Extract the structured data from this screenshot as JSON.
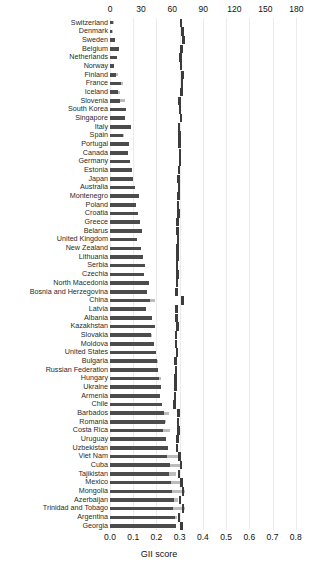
{
  "figure": {
    "axis_title_bottom": "GII score",
    "footnote": ""
  },
  "chart_data": {
    "type": "bar",
    "title": "",
    "subtitle": "",
    "xlabel": "GII score",
    "ylabel": "",
    "orientation": "horizontal",
    "grid": true,
    "legend": "none",
    "top_axis": {
      "label": "",
      "ticks": [
        0,
        30,
        60,
        90,
        120,
        150,
        180
      ],
      "tick_labels": [
        "0",
        "30",
        "60",
        "90",
        "120",
        "150",
        "180"
      ],
      "range": [
        0,
        195
      ],
      "series_name": "GII rank"
    },
    "bottom_axis": {
      "label": "GII score",
      "ticks": [
        0.0,
        0.1,
        0.2,
        0.3,
        0.4,
        0.5,
        0.6,
        0.7,
        0.8
      ],
      "tick_labels": [
        "0.0",
        "0.1",
        "0.2",
        "0.3",
        "0.4",
        "0.5",
        "0.6",
        "0.7",
        "0.8"
      ],
      "range": [
        0.0,
        0.87
      ],
      "series_name": "GII score"
    },
    "categories": [
      "Switzerland",
      "Denmark",
      "Sweden",
      "Belgium",
      "Netherlands",
      "Norway",
      "Finland",
      "France",
      "Iceland",
      "Slovenia",
      "South Korea",
      "Singapore",
      "Italy",
      "Spain",
      "Portugal",
      "Canada",
      "Germany",
      "Estonia",
      "Japan",
      "Australia",
      "Montenegro",
      "Poland",
      "Croatia",
      "Greece",
      "Belarus",
      "United Kingdom",
      "New Zealand",
      "Lithuania",
      "Serbia",
      "Czechia",
      "North Macedonia",
      "Bosnia and Herzegovina",
      "China",
      "Latvia",
      "Albania",
      "Kazakhstan",
      "Slovakia",
      "Moldova",
      "United States",
      "Bulgaria",
      "Russian Federation",
      "Hungary",
      "Ukraine",
      "Armenia",
      "Chile",
      "Barbados",
      "Romania",
      "Costa Rica",
      "Uruguay",
      "Uzbekistan",
      "Viet Nam",
      "Cuba",
      "Tajikistan",
      "Mexico",
      "Mongolia",
      "Azerbaijan",
      "Trinidad and Tobago",
      "Argentina",
      "Georgia"
    ],
    "series": [
      {
        "name": "GII rank",
        "axis": "top",
        "values": [
          3,
          2,
          5,
          9,
          7,
          4,
          6,
          11,
          8,
          10,
          15,
          14,
          20,
          13,
          18,
          17,
          19,
          21,
          22,
          24,
          28,
          25,
          27,
          29,
          31,
          26,
          30,
          32,
          34,
          33,
          38,
          36,
          39,
          35,
          41,
          43,
          40,
          42,
          44,
          45,
          46,
          47,
          49,
          48,
          50,
          52,
          53,
          51,
          54,
          56,
          55,
          58,
          57,
          59,
          60,
          62,
          61,
          63,
          64
        ],
        "color": "#4c4c4c"
      },
      {
        "name": "GII score",
        "axis": "bottom",
        "values": [
          0.018,
          0.013,
          0.023,
          0.039,
          0.025,
          0.016,
          0.033,
          0.054,
          0.043,
          0.063,
          0.067,
          0.065,
          0.057,
          0.059,
          0.071,
          0.069,
          0.073,
          0.086,
          0.083,
          0.073,
          0.092,
          0.109,
          0.092,
          0.119,
          0.103,
          0.098,
          0.105,
          0.107,
          0.131,
          0.12,
          0.143,
          0.136,
          0.192,
          0.142,
          0.144,
          0.163,
          0.18,
          0.174,
          0.179,
          0.206,
          0.203,
          0.221,
          0.2,
          0.216,
          0.187,
          0.252,
          0.243,
          0.259,
          0.24,
          0.227,
          0.296,
          0.303,
          0.285,
          0.309,
          0.322,
          0.294,
          0.323,
          0.287,
          0.28
        ],
        "color": "#bcbcbc"
      },
      {
        "name": "marker",
        "axis": "bottom",
        "values": [
          0.305,
          0.311,
          0.316,
          0.308,
          0.303,
          0.306,
          0.312,
          0.31,
          0.307,
          0.3,
          0.302,
          0.305,
          0.298,
          0.299,
          0.3,
          0.301,
          0.302,
          0.297,
          0.296,
          0.298,
          0.295,
          0.293,
          0.294,
          0.292,
          0.291,
          0.293,
          0.292,
          0.29,
          0.289,
          0.29,
          0.288,
          0.287,
          0.311,
          0.287,
          0.286,
          0.292,
          0.285,
          0.284,
          0.289,
          0.283,
          0.284,
          0.282,
          0.281,
          0.28,
          0.279,
          0.294,
          0.293,
          0.295,
          0.292,
          0.288,
          0.3,
          0.306,
          0.298,
          0.309,
          0.314,
          0.301,
          0.315,
          0.298,
          0.308
        ],
        "color": "#3c3c3c"
      }
    ]
  }
}
